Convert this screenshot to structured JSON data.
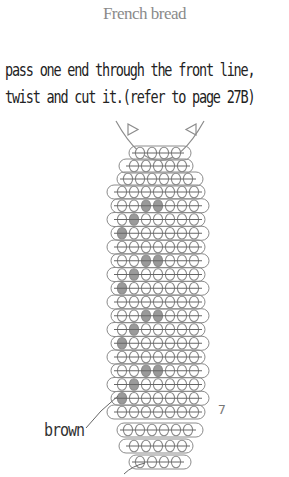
{
  "title": "French bread",
  "instructions": {
    "line1": "pass one end through the front line,",
    "line2": "twist and cut it.(refer to page 27B)"
  },
  "labels": {
    "brown": "brown",
    "row_count": "7"
  },
  "colors": {
    "bead_outline": "#8c8c8c",
    "bead_shaded": "#9a9a9a",
    "line": "#8c8c8c",
    "title": "#8a8a8a",
    "text": "#222222"
  },
  "pattern": {
    "description": "beaded French bread pattern, rows top to bottom; shaded = brown beads",
    "rows": [
      {
        "beads": 4,
        "shaded": []
      },
      {
        "beads": 5,
        "shaded": []
      },
      {
        "beads": 6,
        "shaded": []
      },
      {
        "beads": 7,
        "shaded": []
      },
      {
        "beads": 7,
        "shaded": [
          3,
          4
        ]
      },
      {
        "beads": 7,
        "shaded": [
          2
        ]
      },
      {
        "beads": 7,
        "shaded": [
          1
        ]
      },
      {
        "beads": 7,
        "shaded": []
      },
      {
        "beads": 7,
        "shaded": [
          3,
          4
        ]
      },
      {
        "beads": 7,
        "shaded": [
          2
        ]
      },
      {
        "beads": 7,
        "shaded": [
          1
        ]
      },
      {
        "beads": 7,
        "shaded": []
      },
      {
        "beads": 7,
        "shaded": [
          3,
          4
        ]
      },
      {
        "beads": 7,
        "shaded": [
          2
        ]
      },
      {
        "beads": 7,
        "shaded": [
          1
        ]
      },
      {
        "beads": 7,
        "shaded": []
      },
      {
        "beads": 7,
        "shaded": [
          3,
          4
        ]
      },
      {
        "beads": 7,
        "shaded": [
          2
        ]
      },
      {
        "beads": 7,
        "shaded": [
          1
        ]
      },
      {
        "beads": 7,
        "shaded": []
      },
      {
        "beads": 6,
        "shaded": []
      },
      {
        "beads": 5,
        "shaded": []
      },
      {
        "beads": 4,
        "shaded": []
      }
    ]
  }
}
